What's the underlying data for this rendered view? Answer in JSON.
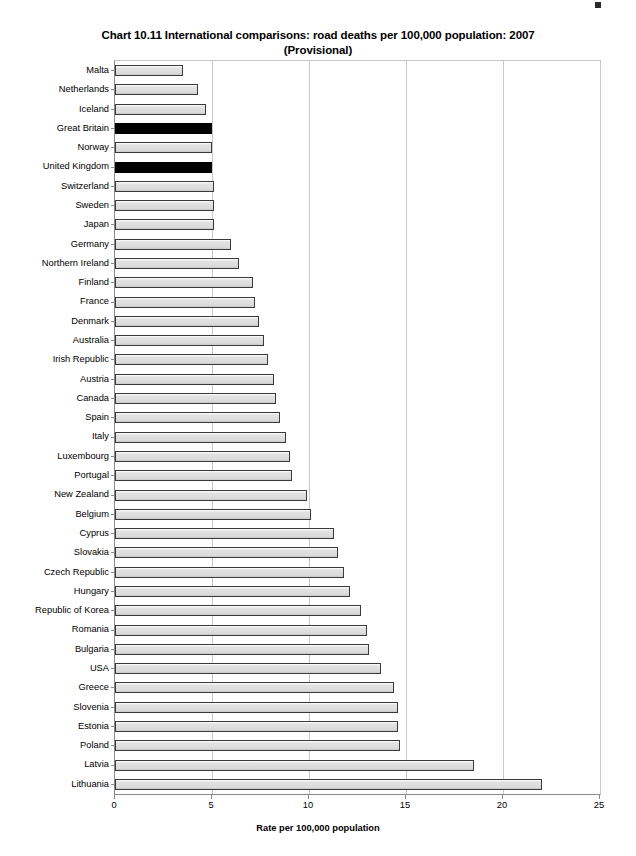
{
  "chart_data": {
    "type": "bar",
    "orientation": "horizontal",
    "title": "Chart 10.11 International comparisons: road deaths per 100,000 population: 2007",
    "subtitle": "(Provisional)",
    "xlabel": "Rate per 100,000 population",
    "ylabel": "",
    "xlim": [
      0,
      25
    ],
    "xticks": [
      0,
      5,
      10,
      15,
      20,
      25
    ],
    "xtick_labels": [
      "0",
      "5",
      "10",
      "15",
      "20",
      "25"
    ],
    "grid": true,
    "legend": "none",
    "highlight_color": "#000000",
    "bar_color": "#dcdcdc",
    "highlighted_categories": [
      "Great Britain",
      "United Kingdom"
    ],
    "categories": [
      "Malta",
      "Netherlands",
      "Iceland",
      "Great Britain",
      "Norway",
      "United Kingdom",
      "Switzerland",
      "Sweden",
      "Japan",
      "Germany",
      "Northern Ireland",
      "Finland",
      "France",
      "Denmark",
      "Australia",
      "Irish Republic",
      "Austria",
      "Canada",
      "Spain",
      "Italy",
      "Luxembourg",
      "Portugal",
      "New Zealand",
      "Belgium",
      "Cyprus",
      "Slovakia",
      "Czech Republic",
      "Hungary",
      "Republic of Korea",
      "Romania",
      "Bulgaria",
      "USA",
      "Greece",
      "Slovenia",
      "Estonia",
      "Poland",
      "Latvia",
      "Lithuania"
    ],
    "values": [
      3.5,
      4.3,
      4.7,
      5.0,
      5.0,
      5.0,
      5.1,
      5.1,
      5.1,
      6.0,
      6.4,
      7.1,
      7.2,
      7.4,
      7.7,
      7.9,
      8.2,
      8.3,
      8.5,
      8.8,
      9.0,
      9.1,
      9.9,
      10.1,
      11.3,
      11.5,
      11.8,
      12.1,
      12.7,
      13.0,
      13.1,
      13.7,
      14.4,
      14.6,
      14.6,
      14.7,
      18.5,
      22.0
    ]
  }
}
